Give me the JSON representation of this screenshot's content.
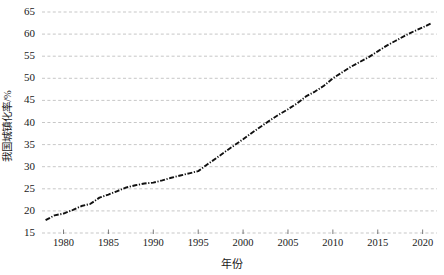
{
  "chart_data": {
    "type": "line",
    "title": "",
    "xlabel": "年份",
    "ylabel": "我国城镇化率/%",
    "xlim": [
      1977.5,
      1922.0
    ],
    "ylim": [
      15,
      65
    ],
    "ytick_step": 5,
    "grid": true,
    "legend": "none",
    "line_style": "dash-dot",
    "line_color": "#111111",
    "grid_color": "#b9b9b9",
    "xticks": [
      1980,
      1985,
      1990,
      1995,
      2000,
      2005,
      2010,
      2015,
      2020
    ],
    "yticks": [
      15,
      20,
      25,
      30,
      35,
      40,
      45,
      50,
      55,
      60,
      65
    ],
    "x": [
      1978,
      1979,
      1980,
      1981,
      1982,
      1983,
      1984,
      1985,
      1986,
      1987,
      1988,
      1989,
      1990,
      1991,
      1992,
      1993,
      1994,
      1995,
      1996,
      1997,
      1998,
      1999,
      2000,
      2001,
      2002,
      2003,
      2004,
      2005,
      2006,
      2007,
      2008,
      2009,
      2010,
      2011,
      2012,
      2013,
      2014,
      2015,
      2016,
      2017,
      2018,
      2019,
      2020,
      2021
    ],
    "values": [
      17.9,
      19.0,
      19.4,
      20.2,
      21.1,
      21.6,
      23.0,
      23.7,
      24.5,
      25.3,
      25.8,
      26.2,
      26.4,
      26.9,
      27.5,
      28.0,
      28.5,
      29.0,
      30.5,
      31.9,
      33.4,
      34.8,
      36.2,
      37.7,
      39.1,
      40.5,
      41.8,
      43.0,
      44.3,
      45.9,
      47.0,
      48.3,
      50.0,
      51.3,
      52.6,
      53.7,
      54.8,
      56.1,
      57.4,
      58.5,
      59.6,
      60.6,
      61.5,
      62.5
    ],
    "series_name": "我国城镇化率"
  }
}
